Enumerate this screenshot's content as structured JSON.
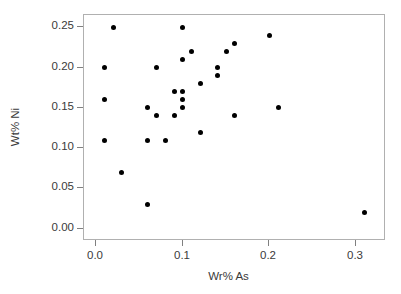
{
  "chart_data": {
    "type": "scatter",
    "title": "",
    "xlabel": "Wr% As",
    "ylabel": "Wt% Ni",
    "xlim": [
      -0.0138,
      0.3345
    ],
    "ylim": [
      -0.0152,
      0.2652
    ],
    "grid": false,
    "legend": null,
    "xticks": [
      0.0,
      0.1,
      0.2,
      0.3
    ],
    "xtick_labels": [
      "0.0",
      "0.1",
      "0.2",
      "0.3"
    ],
    "yticks": [
      0.0,
      0.05,
      0.1,
      0.15,
      0.2,
      0.25
    ],
    "ytick_labels": [
      "0.00",
      "0.05",
      "0.10",
      "0.15",
      "0.20",
      "0.25"
    ],
    "marker": "filled-circle",
    "marker_color": "#000000",
    "points": [
      {
        "x": 0.02,
        "y": 0.25
      },
      {
        "x": 0.1,
        "y": 0.25
      },
      {
        "x": 0.2,
        "y": 0.24
      },
      {
        "x": 0.16,
        "y": 0.23
      },
      {
        "x": 0.11,
        "y": 0.22
      },
      {
        "x": 0.15,
        "y": 0.22
      },
      {
        "x": 0.1,
        "y": 0.21
      },
      {
        "x": 0.01,
        "y": 0.2
      },
      {
        "x": 0.07,
        "y": 0.2
      },
      {
        "x": 0.14,
        "y": 0.2
      },
      {
        "x": 0.14,
        "y": 0.19
      },
      {
        "x": 0.12,
        "y": 0.18
      },
      {
        "x": 0.09,
        "y": 0.17
      },
      {
        "x": 0.1,
        "y": 0.17
      },
      {
        "x": 0.01,
        "y": 0.16
      },
      {
        "x": 0.1,
        "y": 0.16
      },
      {
        "x": 0.06,
        "y": 0.15
      },
      {
        "x": 0.1,
        "y": 0.15
      },
      {
        "x": 0.21,
        "y": 0.15
      },
      {
        "x": 0.07,
        "y": 0.14
      },
      {
        "x": 0.09,
        "y": 0.14
      },
      {
        "x": 0.16,
        "y": 0.14
      },
      {
        "x": 0.12,
        "y": 0.12
      },
      {
        "x": 0.01,
        "y": 0.11
      },
      {
        "x": 0.06,
        "y": 0.11
      },
      {
        "x": 0.08,
        "y": 0.11
      },
      {
        "x": 0.03,
        "y": 0.07
      },
      {
        "x": 0.06,
        "y": 0.03
      },
      {
        "x": 0.31,
        "y": 0.02
      }
    ]
  }
}
